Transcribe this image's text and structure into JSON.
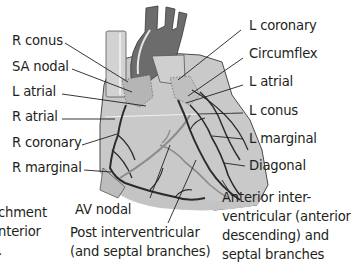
{
  "colors": {
    "heart_fill": "#c8c8c8",
    "heart_outline": "#555555",
    "great_vessel": "#6e6e6e",
    "vessel_highlight": "#e6e6e6",
    "artery": "#2b2b2b",
    "posterior_artery": "#8c8c8c",
    "leader_line": "#231f20",
    "text": "#231f20"
  },
  "labels_left": [
    {
      "id": "r-conus",
      "text": "R conus"
    },
    {
      "id": "sa-nodal",
      "text": "SA nodal"
    },
    {
      "id": "l-atrial-left",
      "text": "L atrial"
    },
    {
      "id": "r-atrial",
      "text": "R atrial"
    },
    {
      "id": "r-coronary",
      "text": "R coronary"
    },
    {
      "id": "r-marginal",
      "text": "R marginal"
    }
  ],
  "labels_right": [
    {
      "id": "l-coronary",
      "text": "L coronary"
    },
    {
      "id": "circumflex",
      "text": "Circumflex"
    },
    {
      "id": "l-atrial-right",
      "text": "L atrial"
    },
    {
      "id": "l-conus",
      "text": "L  conus"
    },
    {
      "id": "l-marginal",
      "text": "L marginal"
    },
    {
      "id": "diagonal",
      "text": "Diagonal"
    }
  ],
  "labels_bottom": {
    "av_nodal": "AV nodal",
    "post_interventricular": "Post interventricular\n(and septal branches)",
    "anterior_interventricular": "Anterior inter-\nventricular (anterior\ndescending) and\nseptal branches"
  },
  "cropped_left_text": "chment\nnterior\n."
}
